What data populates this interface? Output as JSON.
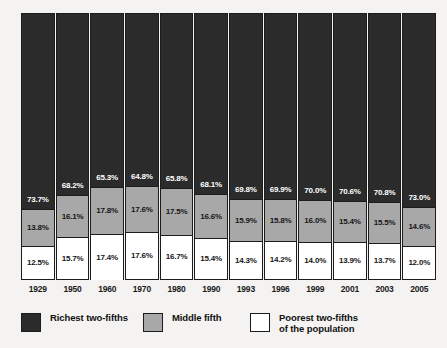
{
  "chart_data": {
    "type": "bar",
    "stacked": true,
    "stack_unit": "percent",
    "title": "",
    "subtitle": "",
    "xlabel": "",
    "ylabel": "",
    "ylim": [
      0,
      100
    ],
    "grid": false,
    "legend_position": "bottom-left",
    "categories": [
      "1929",
      "1950",
      "1960",
      "1970",
      "1980",
      "1990",
      "1993",
      "1996",
      "1999",
      "2001",
      "2003",
      "2005"
    ],
    "series": [
      {
        "name": "Richest two-fifths",
        "color": "#2b2b2b",
        "label_color": "#ffffff",
        "values": [
          73.7,
          68.2,
          65.3,
          64.8,
          65.8,
          68.1,
          69.8,
          69.9,
          70.0,
          70.6,
          70.8,
          73.0
        ],
        "labels": [
          "73.7%",
          "68.2%",
          "65.3%",
          "64.8%",
          "65.8%",
          "68.1%",
          "69.8%",
          "69.9%",
          "70.0%",
          "70.6%",
          "70.8%",
          "73.0%"
        ]
      },
      {
        "name": "Middle fifth",
        "color": "#a8a8a8",
        "label_color": "#161616",
        "values": [
          13.8,
          16.1,
          17.8,
          17.6,
          17.5,
          16.6,
          15.9,
          15.8,
          16.0,
          15.4,
          15.5,
          14.6
        ],
        "labels": [
          "13.8%",
          "16.1%",
          "17.8%",
          "17.6%",
          "17.5%",
          "16.6%",
          "15.9%",
          "15.8%",
          "16.0%",
          "15.4%",
          "15.5%",
          "14.6%"
        ]
      },
      {
        "name": "Poorest two-fifths of the population",
        "color": "#ffffff",
        "label_color": "#161616",
        "values": [
          12.5,
          15.7,
          17.4,
          17.6,
          16.7,
          15.4,
          14.3,
          14.2,
          14.0,
          13.9,
          13.7,
          12.0
        ],
        "labels": [
          "12.5%",
          "15.7%",
          "17.4%",
          "17.6%",
          "16.7%",
          "15.4%",
          "14.3%",
          "14.2%",
          "14.0%",
          "13.9%",
          "13.7%",
          "12.0%"
        ]
      }
    ]
  },
  "legend": {
    "items": [
      {
        "label": "Richest two-fifths",
        "swatch": "dark"
      },
      {
        "label": "Middle fifth",
        "swatch": "gray"
      },
      {
        "label": "Poorest two-fifths\nof the population",
        "swatch": "white"
      }
    ]
  },
  "colors": {
    "background": "#f4f3f1",
    "richest": "#2b2b2b",
    "middle": "#a8a8a8",
    "poorest": "#ffffff",
    "outline": "#1c1c1c",
    "text": "#1a1a1a"
  }
}
